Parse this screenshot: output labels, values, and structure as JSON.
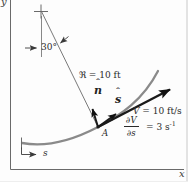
{
  "figure": {
    "kind": "normal-tangential path coordinates diagram"
  },
  "axes": {
    "x_label": "x",
    "y_label": "y"
  },
  "labels": {
    "angle": "30°",
    "radius": "ℜ = 10 ft",
    "point": "A",
    "arc_length": "s",
    "velocity_var": "V",
    "velocity_rest": " = 10 ft/s",
    "gradient_numerator": "∂V",
    "gradient_denominator": "∂s",
    "gradient_rhs": "= 3 s",
    "gradient_exponent": "-1"
  },
  "vectors": {
    "normal": {
      "hat": "ˆ",
      "letter": "n"
    },
    "tangent": {
      "hat": "ˆ",
      "letter": "s"
    }
  },
  "colors": {
    "ink": "#1a1a1a",
    "thin_line": "#6a6a6a",
    "curve": "#8a8a8a",
    "text": "#2a2a2a"
  }
}
